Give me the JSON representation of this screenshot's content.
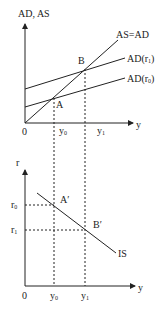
{
  "top_chart": {
    "y_axis_label": "AD, AS",
    "x_axis_label": "y",
    "origin_label": "0",
    "lines": [
      {
        "label": "AS=AD"
      },
      {
        "label": "AD(r",
        "sub": "1",
        "close": ")"
      },
      {
        "label": "AD(r",
        "sub": "0",
        "close": ")"
      }
    ],
    "points": [
      {
        "label": "A"
      },
      {
        "label": "B"
      }
    ],
    "x_ticks": [
      {
        "label": "y",
        "sub": "0"
      },
      {
        "label": "y",
        "sub": "1"
      }
    ]
  },
  "bottom_chart": {
    "y_axis_label": "r",
    "x_axis_label": "y",
    "origin_label": "0",
    "curve_label": "IS",
    "points": [
      {
        "label": "A′"
      },
      {
        "label": "B′"
      }
    ],
    "y_ticks": [
      {
        "label": "r",
        "sub": "0"
      },
      {
        "label": "r",
        "sub": "1"
      }
    ],
    "x_ticks": [
      {
        "label": "y",
        "sub": "0"
      },
      {
        "label": "y",
        "sub": "1"
      }
    ]
  },
  "colors": {
    "line": "#222222",
    "background": "#ffffff"
  }
}
